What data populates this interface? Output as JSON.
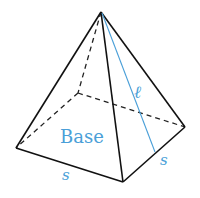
{
  "diagram": {
    "labels": {
      "base": "Base",
      "slant_height": "ℓ",
      "side_front": "s",
      "side_right": "s"
    },
    "colors": {
      "edges": "#111111",
      "accent": "#4a9fd8"
    }
  }
}
